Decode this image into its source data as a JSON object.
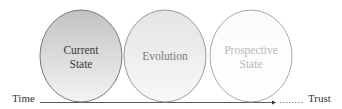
{
  "diagram": {
    "stages": [
      {
        "label_line1": "Current",
        "label_line2": "State",
        "fill_top": "#c4c4c4",
        "fill_bottom": "#f2f2f2",
        "text_color": "#3a3a3a"
      },
      {
        "label_line1": "Evolution",
        "label_line2": "",
        "fill_top": "#e6e6e6",
        "fill_bottom": "#f8f8f8",
        "text_color": "#777777"
      },
      {
        "label_line1": "Prospective",
        "label_line2": "State",
        "fill_top": "#fafafa",
        "fill_bottom": "#ffffff",
        "text_color": "#b5b5b5"
      }
    ],
    "axis": {
      "start_label": "Time",
      "end_label": "Trust",
      "line_color": "#555555"
    }
  }
}
